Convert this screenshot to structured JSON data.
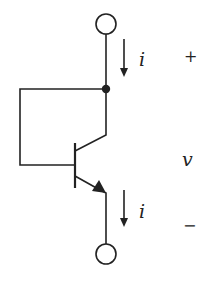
{
  "diagram": {
    "type": "circuit",
    "colors": {
      "stroke": "#222222",
      "background": "#ffffff"
    },
    "labels": {
      "current_top": "i",
      "current_bottom": "i",
      "voltage": "v",
      "plus": "+",
      "minus": "−"
    },
    "components": [
      {
        "id": "terminal-top",
        "kind": "terminal"
      },
      {
        "id": "junction-node",
        "kind": "node"
      },
      {
        "id": "bjt-npn",
        "kind": "transistor",
        "collector_base_shorted": true
      },
      {
        "id": "terminal-bottom",
        "kind": "terminal"
      }
    ]
  }
}
